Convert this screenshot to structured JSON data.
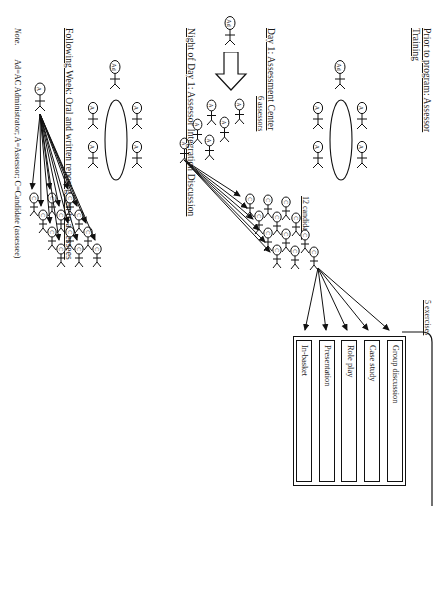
{
  "figure": {
    "orientation": "page rotated 90 degrees"
  },
  "sections": [
    {
      "id": "prior",
      "heading": "Prior to program: Assessor Training"
    },
    {
      "id": "day1",
      "heading": "Day 1: Assessment Center"
    },
    {
      "id": "night",
      "heading": "Night of Day 1: Assessor Integration Discussion"
    },
    {
      "id": "following",
      "heading": "Following Week: Oral and written report given to assessees"
    }
  ],
  "group_labels": {
    "assessors": "6 assessors",
    "candidates": "12 candidates",
    "exercises": "5 exercises"
  },
  "exercises": [
    "Group discussion",
    "Case study",
    "Role play",
    "Presentation",
    "In-basket"
  ],
  "person_markers": {
    "administrator": "Ad",
    "assessor": "A",
    "candidate": "C"
  },
  "note": {
    "label": "Note.",
    "text": "Ad=AC Administrator; A=Assessor; C=Candidate (assessee)"
  },
  "colors": {
    "ink": "#111111",
    "paper": "#ffffff"
  },
  "counts": {
    "assessors": 6,
    "candidates": 12,
    "exercises": 5
  }
}
